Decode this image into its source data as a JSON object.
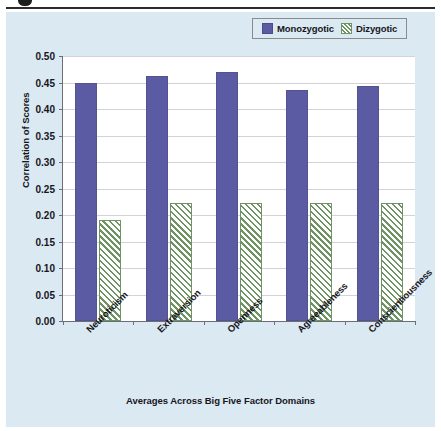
{
  "chart_data": {
    "type": "bar",
    "title": "",
    "xlabel": "Averages Across Big Five Factor Domains",
    "ylabel": "Correlation of Scores",
    "categories": [
      "Neuroticism",
      "Extraversion",
      "Openness",
      "Agreeableness",
      "Conscientiousness"
    ],
    "series": [
      {
        "name": "Monozygotic",
        "values": [
          0.45,
          0.4625,
          0.47,
          0.435,
          0.4425
        ],
        "color": "#5b5ba3"
      },
      {
        "name": "Dizygotic",
        "values": [
          0.19,
          0.2225,
          0.2225,
          0.2225,
          0.2225
        ],
        "color": "#6f9464"
      }
    ],
    "ylim": [
      0.0,
      0.5
    ],
    "ytick_values": [
      0.0,
      0.05,
      0.1,
      0.15,
      0.2,
      0.25,
      0.3,
      0.35,
      0.4,
      0.45,
      0.5
    ],
    "ytick_labels": [
      "0.00",
      "0.05",
      "0.10",
      "0.15",
      "0.20",
      "0.25",
      "0.30",
      "0.35",
      "0.40",
      "0.45",
      "0.50"
    ],
    "grid": true,
    "legend_position": "top-right",
    "xtick_rotation": -45
  },
  "legend": {
    "entries": [
      {
        "label": "Monozygotic",
        "swatch": "solid-purple-swatch"
      },
      {
        "label": "Dizygotic",
        "swatch": "hatched-green-swatch"
      }
    ]
  },
  "colors": {
    "panel_background": "#dbe9f2",
    "plot_background": "#ffffff",
    "monozygotic": "#5b5ba3",
    "dizygotic_hatch": "#6f9464",
    "axis": "#6d6d78",
    "gridline": "#d2d2d8",
    "text": "#16161c",
    "top_rule": "#2b2b2b"
  }
}
